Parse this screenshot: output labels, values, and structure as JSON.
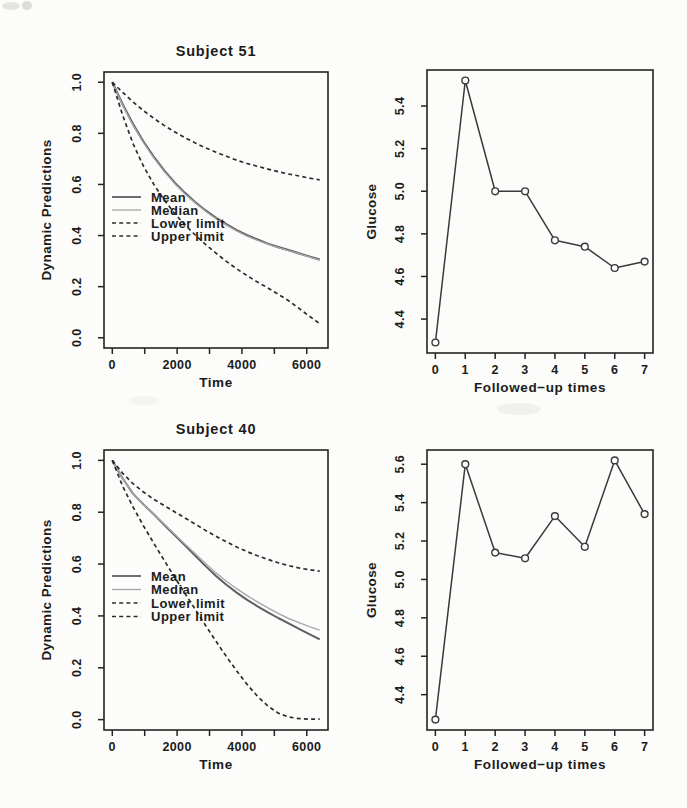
{
  "page": {
    "background": "#fcfcfa",
    "text_color": "#1b1b1b",
    "axis_color": "#242424"
  },
  "scan_artifacts": [
    {
      "x": 2,
      "y": 2,
      "w": 18,
      "h": 8,
      "color": "#e2e2dc",
      "opacity": 0.9
    },
    {
      "x": 22,
      "y": 1,
      "w": 10,
      "h": 9,
      "color": "#d9d9d3",
      "opacity": 0.9
    },
    {
      "x": 497,
      "y": 403,
      "w": 44,
      "h": 12,
      "color": "#f0f0ea",
      "opacity": 0.9
    },
    {
      "x": 129,
      "y": 396,
      "w": 30,
      "h": 9,
      "color": "#f2f2ec",
      "opacity": 0.8
    }
  ],
  "chart_data": [
    {
      "id": "subject-51-predictions",
      "type": "line",
      "title": "Subject 51",
      "xlabel": "Time",
      "ylabel": "Dynamic Predictions",
      "xlim": [
        0,
        6400
      ],
      "ylim": [
        0,
        1
      ],
      "grid": false,
      "show_legend": true,
      "legend_position": "left-middle",
      "xticks": [
        {
          "v": 0,
          "l": "0"
        },
        {
          "v": 1000,
          "l": ""
        },
        {
          "v": 2000,
          "l": "2000"
        },
        {
          "v": 3000,
          "l": ""
        },
        {
          "v": 4000,
          "l": "4000"
        },
        {
          "v": 5000,
          "l": ""
        },
        {
          "v": 6000,
          "l": "6000"
        }
      ],
      "yticks": [
        {
          "v": 0.0,
          "l": "0.0"
        },
        {
          "v": 0.2,
          "l": "0.2"
        },
        {
          "v": 0.4,
          "l": "0.4"
        },
        {
          "v": 0.6,
          "l": "0.6"
        },
        {
          "v": 0.8,
          "l": "0.8"
        },
        {
          "v": 1.0,
          "l": "1.0"
        }
      ],
      "x": [
        0,
        320,
        640,
        960,
        1280,
        1600,
        1920,
        2240,
        2560,
        2880,
        3200,
        3520,
        3840,
        4160,
        4480,
        4800,
        5120,
        5440,
        5760,
        6080,
        6400
      ],
      "series": [
        {
          "name": "Mean",
          "style": "solid",
          "color": "#5f5f5f",
          "width": 2.2,
          "y": [
            1.0,
            0.913,
            0.836,
            0.768,
            0.708,
            0.655,
            0.608,
            0.567,
            0.53,
            0.498,
            0.469,
            0.444,
            0.421,
            0.401,
            0.384,
            0.368,
            0.355,
            0.343,
            0.33,
            0.318,
            0.306
          ]
        },
        {
          "name": "Median",
          "style": "solid",
          "color": "#a8a8a8",
          "width": 1.3,
          "y": [
            1.0,
            0.91,
            0.832,
            0.764,
            0.704,
            0.651,
            0.604,
            0.563,
            0.527,
            0.495,
            0.466,
            0.441,
            0.418,
            0.398,
            0.381,
            0.366,
            0.353,
            0.341,
            0.329,
            0.317,
            0.304
          ]
        },
        {
          "name": "Lower limit",
          "style": "dashed",
          "color": "#2c2c2c",
          "width": 1.7,
          "y": [
            1.0,
            0.87,
            0.76,
            0.672,
            0.6,
            0.54,
            0.487,
            0.442,
            0.402,
            0.365,
            0.331,
            0.299,
            0.27,
            0.243,
            0.218,
            0.195,
            0.17,
            0.145,
            0.115,
            0.085,
            0.055
          ]
        },
        {
          "name": "Upper limit",
          "style": "dashed",
          "color": "#2c2c2c",
          "width": 1.7,
          "y": [
            1.0,
            0.96,
            0.923,
            0.889,
            0.859,
            0.831,
            0.806,
            0.783,
            0.762,
            0.743,
            0.726,
            0.71,
            0.695,
            0.682,
            0.671,
            0.66,
            0.65,
            0.641,
            0.633,
            0.625,
            0.618
          ]
        }
      ]
    },
    {
      "id": "subject-51-glucose",
      "type": "line",
      "title": "",
      "xlabel": "Followed−up times",
      "ylabel": "Glucose",
      "xlim": [
        0,
        7
      ],
      "ylim": [
        4.29,
        5.52
      ],
      "grid": false,
      "show_legend": false,
      "marker": "open-circle",
      "xticks": [
        {
          "v": 0,
          "l": "0"
        },
        {
          "v": 1,
          "l": "1"
        },
        {
          "v": 2,
          "l": "2"
        },
        {
          "v": 3,
          "l": "3"
        },
        {
          "v": 4,
          "l": "4"
        },
        {
          "v": 5,
          "l": "5"
        },
        {
          "v": 6,
          "l": "6"
        },
        {
          "v": 7,
          "l": "7"
        }
      ],
      "yticks": [
        {
          "v": 4.4,
          "l": "4.4"
        },
        {
          "v": 4.6,
          "l": "4.6"
        },
        {
          "v": 4.8,
          "l": "4.8"
        },
        {
          "v": 5.0,
          "l": "5.0"
        },
        {
          "v": 5.2,
          "l": "5.2"
        },
        {
          "v": 5.4,
          "l": "5.4"
        }
      ],
      "x": [
        0,
        1,
        2,
        3,
        4,
        5,
        6,
        7
      ],
      "series": [
        {
          "name": "Glucose",
          "style": "solid",
          "color": "#3a3a3a",
          "width": 1.5,
          "y": [
            4.29,
            5.52,
            5.0,
            5.0,
            4.77,
            4.74,
            4.64,
            4.67
          ]
        }
      ]
    },
    {
      "id": "subject-40-predictions",
      "type": "line",
      "title": "Subject 40",
      "xlabel": "Time",
      "ylabel": "Dynamic Predictions",
      "xlim": [
        0,
        6400
      ],
      "ylim": [
        0,
        1
      ],
      "grid": false,
      "show_legend": true,
      "legend_position": "left-middle",
      "xticks": [
        {
          "v": 0,
          "l": "0"
        },
        {
          "v": 1000,
          "l": ""
        },
        {
          "v": 2000,
          "l": "2000"
        },
        {
          "v": 3000,
          "l": ""
        },
        {
          "v": 4000,
          "l": "4000"
        },
        {
          "v": 5000,
          "l": ""
        },
        {
          "v": 6000,
          "l": "6000"
        }
      ],
      "yticks": [
        {
          "v": 0.0,
          "l": "0.0"
        },
        {
          "v": 0.2,
          "l": "0.2"
        },
        {
          "v": 0.4,
          "l": "0.4"
        },
        {
          "v": 0.6,
          "l": "0.6"
        },
        {
          "v": 0.8,
          "l": "0.8"
        },
        {
          "v": 1.0,
          "l": "1.0"
        }
      ],
      "x": [
        0,
        320,
        640,
        960,
        1280,
        1600,
        1920,
        2240,
        2560,
        2880,
        3200,
        3520,
        3840,
        4160,
        4480,
        4800,
        5120,
        5440,
        5760,
        6080,
        6400
      ],
      "series": [
        {
          "name": "Mean",
          "style": "solid",
          "color": "#5f5f5f",
          "width": 2.0,
          "y": [
            1.0,
            0.93,
            0.872,
            0.83,
            0.792,
            0.752,
            0.712,
            0.672,
            0.632,
            0.592,
            0.554,
            0.52,
            0.49,
            0.462,
            0.437,
            0.414,
            0.392,
            0.371,
            0.35,
            0.33,
            0.31
          ]
        },
        {
          "name": "Median",
          "style": "solid",
          "color": "#a8a8a8",
          "width": 1.4,
          "y": [
            1.0,
            0.93,
            0.872,
            0.83,
            0.792,
            0.754,
            0.716,
            0.678,
            0.64,
            0.602,
            0.566,
            0.534,
            0.505,
            0.478,
            0.454,
            0.431,
            0.41,
            0.39,
            0.374,
            0.359,
            0.345
          ]
        },
        {
          "name": "Lower limit",
          "style": "dashed",
          "color": "#2c2c2c",
          "width": 1.7,
          "y": [
            1.0,
            0.9,
            0.82,
            0.748,
            0.68,
            0.615,
            0.55,
            0.487,
            0.425,
            0.363,
            0.302,
            0.243,
            0.188,
            0.136,
            0.09,
            0.052,
            0.025,
            0.01,
            0.004,
            0.002,
            0.002
          ]
        },
        {
          "name": "Upper limit",
          "style": "dashed",
          "color": "#2c2c2c",
          "width": 1.7,
          "y": [
            1.0,
            0.95,
            0.91,
            0.878,
            0.85,
            0.826,
            0.802,
            0.778,
            0.754,
            0.73,
            0.707,
            0.686,
            0.666,
            0.648,
            0.632,
            0.618,
            0.605,
            0.594,
            0.585,
            0.578,
            0.573
          ]
        }
      ]
    },
    {
      "id": "subject-40-glucose",
      "type": "line",
      "title": "",
      "xlabel": "Followed−up times",
      "ylabel": "Glucose",
      "xlim": [
        0,
        7
      ],
      "ylim": [
        4.27,
        5.62
      ],
      "grid": false,
      "show_legend": false,
      "marker": "open-circle",
      "xticks": [
        {
          "v": 0,
          "l": "0"
        },
        {
          "v": 1,
          "l": "1"
        },
        {
          "v": 2,
          "l": "2"
        },
        {
          "v": 3,
          "l": "3"
        },
        {
          "v": 4,
          "l": "4"
        },
        {
          "v": 5,
          "l": "5"
        },
        {
          "v": 6,
          "l": "6"
        },
        {
          "v": 7,
          "l": "7"
        }
      ],
      "yticks": [
        {
          "v": 4.4,
          "l": "4.4"
        },
        {
          "v": 4.6,
          "l": "4.6"
        },
        {
          "v": 4.8,
          "l": "4.8"
        },
        {
          "v": 5.0,
          "l": "5.0"
        },
        {
          "v": 5.2,
          "l": "5.2"
        },
        {
          "v": 5.4,
          "l": "5.4"
        },
        {
          "v": 5.6,
          "l": "5.6"
        }
      ],
      "x": [
        0,
        1,
        2,
        3,
        4,
        5,
        6,
        7
      ],
      "series": [
        {
          "name": "Glucose",
          "style": "solid",
          "color": "#3a3a3a",
          "width": 1.5,
          "y": [
            4.27,
            5.6,
            5.14,
            5.11,
            5.33,
            5.17,
            5.62,
            5.34
          ]
        }
      ]
    }
  ]
}
